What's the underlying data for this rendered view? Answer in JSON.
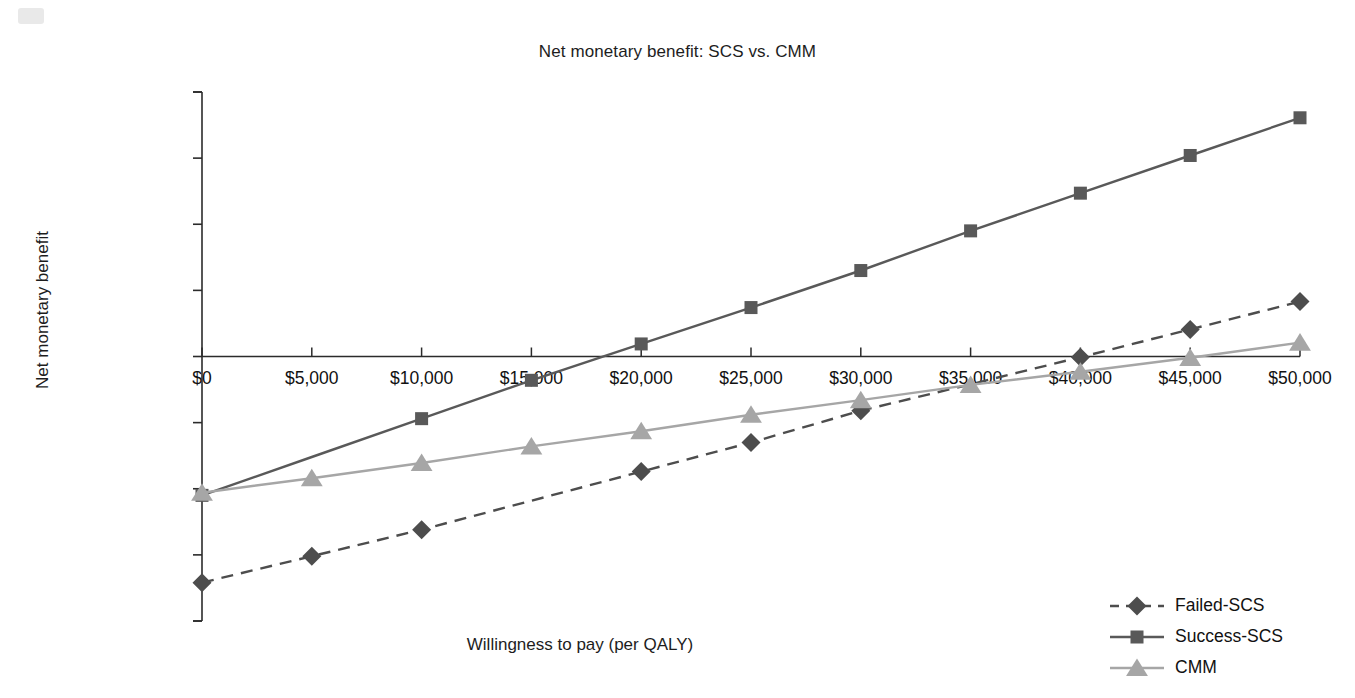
{
  "chart_data": {
    "type": "line",
    "title": "Net monetary benefit: SCS vs. CMM",
    "xlabel": "Willingness to pay (per QALY)",
    "ylabel": "Net monetary benefit",
    "x": [
      0,
      5000,
      10000,
      15000,
      20000,
      25000,
      30000,
      35000,
      40000,
      45000,
      50000
    ],
    "xtick_labels": [
      "$0",
      "$5,000",
      "$10,000",
      "$15,000",
      "$20,000",
      "$25,000",
      "$30,000",
      "$35,000",
      "$40,000",
      "$45,000",
      "$50,000"
    ],
    "ytick_labels": [
      "$200,000",
      "$150,000",
      "$100,000",
      "$50,000",
      "$0",
      "−$50,000",
      "−$100,000",
      "−$150,000",
      "−$200,000"
    ],
    "ytick_values": [
      200000,
      150000,
      100000,
      50000,
      0,
      -50000,
      -100000,
      -150000,
      -200000
    ],
    "xlim": [
      0,
      50000
    ],
    "ylim": [
      -200000,
      200000
    ],
    "grid": false,
    "legend_position": "bottom-right",
    "series": [
      {
        "name": "Failed-SCS",
        "color": "#4d4d4d",
        "line_style": "dashed",
        "marker": "diamond",
        "values": [
          -171000,
          -151000,
          -131000,
          -109000,
          -87000,
          -65000,
          -41000,
          -21000,
          -500,
          20500,
          41500
        ],
        "markers_shown": [
          true,
          true,
          true,
          false,
          true,
          true,
          true,
          false,
          true,
          true,
          true
        ]
      },
      {
        "name": "Success-SCS",
        "color": "#595959",
        "line_style": "solid",
        "marker": "square",
        "values": [
          -105000,
          -76000,
          -47000,
          -18000,
          9500,
          37000,
          65000,
          95000,
          123500,
          152000,
          180500
        ],
        "markers_shown": [
          true,
          false,
          true,
          true,
          true,
          true,
          true,
          true,
          true,
          true,
          true
        ]
      },
      {
        "name": "CMM",
        "color": "#a6a6a6",
        "line_style": "solid",
        "marker": "triangle",
        "values": [
          -103000,
          -92000,
          -80500,
          -68000,
          -56500,
          -44000,
          -33000,
          -21500,
          -11500,
          -1000,
          10500
        ],
        "markers_shown": [
          true,
          true,
          true,
          true,
          true,
          true,
          true,
          true,
          true,
          true,
          true
        ]
      }
    ]
  },
  "legend": {
    "items": [
      {
        "label": "Failed-SCS"
      },
      {
        "label": "Success-SCS"
      },
      {
        "label": "CMM"
      }
    ]
  }
}
